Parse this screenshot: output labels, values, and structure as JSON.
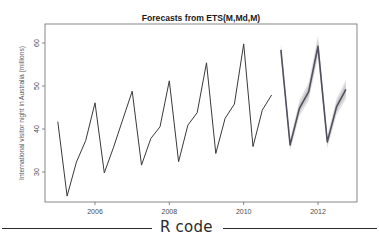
{
  "chart_data": {
    "type": "line",
    "title": "Forecasts from ETS(M,Md,M)",
    "xlabel": "",
    "ylabel": "International visitor night in Australia (millions)",
    "x_ticks": [
      2006,
      2008,
      2010,
      2012
    ],
    "y_ticks": [
      30,
      40,
      50,
      60
    ],
    "xlim": [
      2004.65,
      2013.05
    ],
    "ylim": [
      22.7,
      64.2
    ],
    "grid": false,
    "legend": null,
    "series": [
      {
        "name": "observed",
        "color": "#3a3a3a",
        "x": [
          2005.0,
          2005.25,
          2005.5,
          2005.75,
          2006.0,
          2006.25,
          2006.5,
          2006.75,
          2007.0,
          2007.25,
          2007.5,
          2007.75,
          2008.0,
          2008.25,
          2008.5,
          2008.75,
          2009.0,
          2009.25,
          2009.5,
          2009.75,
          2010.0,
          2010.25,
          2010.5,
          2010.75
        ],
        "values": [
          41.7,
          24.4,
          32.3,
          37.3,
          46.1,
          29.8,
          35.8,
          42.3,
          48.8,
          31.6,
          37.8,
          40.5,
          51.2,
          32.4,
          40.9,
          43.8,
          55.4,
          34.3,
          42.5,
          45.8,
          59.8,
          35.9,
          44.4,
          47.9
        ]
      },
      {
        "name": "forecast",
        "color": "#505060",
        "x": [
          2011.0,
          2011.25,
          2011.5,
          2011.75,
          2012.0,
          2012.25,
          2012.5,
          2012.75
        ],
        "values": [
          58.4,
          36.3,
          44.8,
          48.7,
          59.2,
          37.0,
          45.2,
          49.2
        ],
        "interval_color": "#c8c8c8",
        "interval_80_halfwidth": [
          0.9,
          0.8,
          1.1,
          1.3,
          1.6,
          0.9,
          1.2,
          1.4
        ],
        "interval_95_halfwidth": [
          1.5,
          1.3,
          1.8,
          2.1,
          2.6,
          1.4,
          1.9,
          2.2
        ]
      }
    ]
  },
  "section_divider": {
    "label": "R code"
  }
}
